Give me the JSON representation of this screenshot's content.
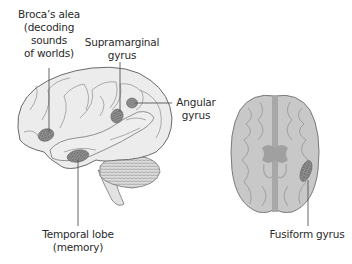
{
  "diagram": {
    "type": "anatomical-illustration",
    "figures": [
      {
        "name": "lateral-brain-view",
        "description": "Side view of left hemisphere with cerebellum and brainstem"
      },
      {
        "name": "axial-brain-view",
        "description": "Top-down view of brain with two hemispheres"
      }
    ],
    "labels": {
      "broca": {
        "line1": "Broca’s alea",
        "line2": "(decoding",
        "line3": "sounds",
        "line4": "of worlds)"
      },
      "supramarginal": {
        "line1": "Supramarginal",
        "line2": "gyrus"
      },
      "angular": {
        "line1": "Angular",
        "line2": "gyrus"
      },
      "temporal": {
        "line1": "Temporal lobe",
        "line2": "(memory)"
      },
      "fusiform": {
        "line1": "Fusiform gyrus"
      }
    },
    "colors": {
      "brain_fill": "#ececec",
      "brain_outline": "#6a6a6a",
      "region_fill": "#8a8a8a",
      "axial_fill": "#c8c8c8",
      "midline": "#9a9a9a",
      "leader_line": "#555555",
      "text": "#2a2a2a"
    }
  }
}
